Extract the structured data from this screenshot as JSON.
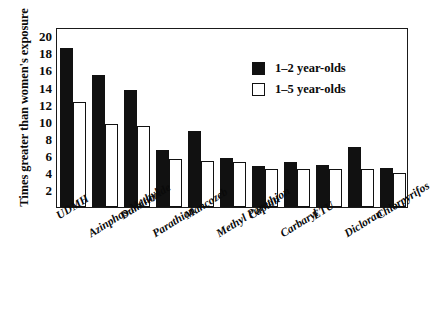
{
  "chart_data": {
    "type": "bar",
    "title": "",
    "xlabel": "",
    "ylabel": "Times greater than women's exposure",
    "ylim": [
      0,
      21
    ],
    "yticks": [
      2,
      4,
      6,
      8,
      10,
      12,
      14,
      16,
      18,
      20
    ],
    "grid": false,
    "legend_position": "top-right",
    "categories": [
      "UDMH",
      "Azinphos-Methyl",
      "Daminozide",
      "Parathion",
      "Mancozeb",
      "Methyl Parathion",
      "Captan",
      "Carbaryl",
      "ETU",
      "Dicloran",
      "Chlorpyrifos"
    ],
    "series": [
      {
        "name": "1–2 year-olds",
        "color": "#111111",
        "values": [
          18.6,
          15.4,
          13.6,
          6.6,
          8.9,
          5.7,
          4.8,
          5.3,
          4.9,
          7.0,
          4.6
        ]
      },
      {
        "name": "1–5 year-olds",
        "color": "#ffffff",
        "values": [
          12.2,
          9.7,
          9.4,
          5.6,
          5.4,
          5.3,
          4.4,
          4.4,
          4.4,
          4.4,
          4.0
        ]
      }
    ]
  },
  "legend": {
    "items": [
      {
        "label": "1–2 year-olds",
        "swatch": "dark"
      },
      {
        "label": "1–5 year-olds",
        "swatch": "light"
      }
    ]
  }
}
